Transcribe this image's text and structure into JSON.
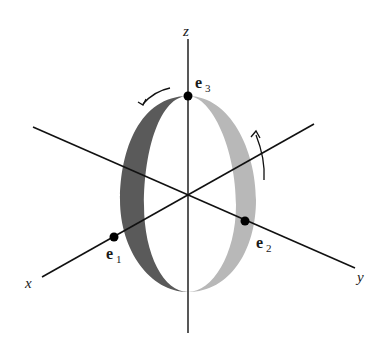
{
  "diagram": {
    "axes": {
      "x": {
        "label": "x"
      },
      "y": {
        "label": "y"
      },
      "z": {
        "label": "z"
      }
    },
    "points": [
      {
        "name": "e",
        "subscript": "1"
      },
      {
        "name": "e",
        "subscript": "2"
      },
      {
        "name": "e",
        "subscript": "3"
      }
    ],
    "ring": {
      "dark_half_color": "#5a5a5a",
      "light_half_color": "#b4b4b4"
    },
    "rotation_arrows": 2
  }
}
